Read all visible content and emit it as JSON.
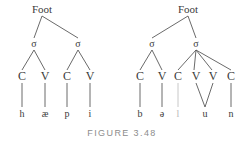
{
  "figure": {
    "caption": "FIGURE 3.48",
    "caption_color": "#8c8c8c",
    "line_color": "#595959",
    "text_color": "#3a3a3a",
    "faint_color": "#b9b9b9",
    "background": "#ffffff"
  },
  "trees": [
    {
      "id": "left-tree",
      "word": "happy",
      "root": {
        "label": "Foot",
        "x": 42,
        "y": 9
      },
      "syllables": [
        {
          "label": "σ",
          "x": 34,
          "y": 44
        },
        {
          "label": "σ",
          "x": 78,
          "y": 44
        }
      ],
      "slots": [
        {
          "label": "C",
          "x": 22,
          "y": 76,
          "syllable": 0
        },
        {
          "label": "V",
          "x": 45,
          "y": 76,
          "syllable": 0
        },
        {
          "label": "C",
          "x": 67,
          "y": 76,
          "syllable": 1
        },
        {
          "label": "V",
          "x": 90,
          "y": 76,
          "syllable": 1
        }
      ],
      "segments": [
        {
          "label": "h",
          "x": 22,
          "y": 114,
          "faint": false
        },
        {
          "label": "æ",
          "x": 45,
          "y": 114,
          "faint": false
        },
        {
          "label": "p",
          "x": 67,
          "y": 114,
          "faint": false
        },
        {
          "label": "i",
          "x": 90,
          "y": 114,
          "faint": false
        }
      ],
      "edges": [
        {
          "from": "foot",
          "to": "sigma-0",
          "x1": 42,
          "y1": 16,
          "x2": 34,
          "y2": 38,
          "faint": false
        },
        {
          "from": "foot",
          "to": "sigma-1",
          "x1": 42,
          "y1": 16,
          "x2": 78,
          "y2": 38,
          "faint": false
        },
        {
          "from": "sigma-0",
          "to": "slot-0",
          "x1": 34,
          "y1": 50,
          "x2": 22,
          "y2": 70,
          "faint": false
        },
        {
          "from": "sigma-0",
          "to": "slot-1",
          "x1": 34,
          "y1": 50,
          "x2": 45,
          "y2": 70,
          "faint": false
        },
        {
          "from": "sigma-1",
          "to": "slot-2",
          "x1": 78,
          "y1": 50,
          "x2": 67,
          "y2": 70,
          "faint": false
        },
        {
          "from": "sigma-1",
          "to": "slot-3",
          "x1": 78,
          "y1": 50,
          "x2": 90,
          "y2": 70,
          "faint": false
        },
        {
          "from": "slot-0",
          "to": "seg-0",
          "x1": 22,
          "y1": 83,
          "x2": 22,
          "y2": 107,
          "faint": false
        },
        {
          "from": "slot-1",
          "to": "seg-1",
          "x1": 45,
          "y1": 83,
          "x2": 45,
          "y2": 107,
          "faint": false
        },
        {
          "from": "slot-2",
          "to": "seg-2",
          "x1": 67,
          "y1": 83,
          "x2": 67,
          "y2": 107,
          "faint": false
        },
        {
          "from": "slot-3",
          "to": "seg-3",
          "x1": 90,
          "y1": 83,
          "x2": 90,
          "y2": 107,
          "faint": false
        }
      ]
    },
    {
      "id": "right-tree",
      "word": "balloon",
      "root": {
        "label": "Foot",
        "x": 188,
        "y": 9
      },
      "syllables": [
        {
          "label": "σ",
          "x": 152,
          "y": 44
        },
        {
          "label": "σ",
          "x": 196,
          "y": 44
        }
      ],
      "slots": [
        {
          "label": "C",
          "x": 140,
          "y": 76,
          "syllable": 0
        },
        {
          "label": "V",
          "x": 162,
          "y": 76,
          "syllable": 0
        },
        {
          "label": "C",
          "x": 178,
          "y": 76,
          "syllable": 1
        },
        {
          "label": "V",
          "x": 196,
          "y": 76,
          "syllable": 1
        },
        {
          "label": "V",
          "x": 213,
          "y": 76,
          "syllable": 1
        },
        {
          "label": "C",
          "x": 231,
          "y": 76,
          "syllable": 1
        }
      ],
      "segments": [
        {
          "label": "b",
          "x": 140,
          "y": 114,
          "faint": false
        },
        {
          "label": "ə",
          "x": 162,
          "y": 114,
          "faint": false
        },
        {
          "label": "l",
          "x": 178,
          "y": 114,
          "faint": true
        },
        {
          "label": "u",
          "x": 205,
          "y": 114,
          "faint": false
        },
        {
          "label": "n",
          "x": 231,
          "y": 114,
          "faint": false
        }
      ],
      "edges": [
        {
          "from": "foot",
          "to": "sigma-0",
          "x1": 188,
          "y1": 16,
          "x2": 152,
          "y2": 38,
          "faint": false
        },
        {
          "from": "foot",
          "to": "sigma-1",
          "x1": 188,
          "y1": 16,
          "x2": 196,
          "y2": 38,
          "faint": false
        },
        {
          "from": "sigma-0",
          "to": "slot-0",
          "x1": 152,
          "y1": 50,
          "x2": 140,
          "y2": 70,
          "faint": false
        },
        {
          "from": "sigma-0",
          "to": "slot-1",
          "x1": 152,
          "y1": 50,
          "x2": 162,
          "y2": 70,
          "faint": false
        },
        {
          "from": "sigma-1",
          "to": "slot-2",
          "x1": 196,
          "y1": 50,
          "x2": 178,
          "y2": 70,
          "faint": false
        },
        {
          "from": "sigma-1",
          "to": "slot-3",
          "x1": 196,
          "y1": 50,
          "x2": 194,
          "y2": 70,
          "faint": false
        },
        {
          "from": "sigma-1",
          "to": "slot-4",
          "x1": 196,
          "y1": 50,
          "x2": 212,
          "y2": 70,
          "faint": false
        },
        {
          "from": "sigma-1",
          "to": "slot-5",
          "x1": 196,
          "y1": 50,
          "x2": 231,
          "y2": 70,
          "faint": false
        },
        {
          "from": "slot-0",
          "to": "seg-0",
          "x1": 140,
          "y1": 83,
          "x2": 140,
          "y2": 107,
          "faint": false
        },
        {
          "from": "slot-1",
          "to": "seg-1",
          "x1": 162,
          "y1": 83,
          "x2": 162,
          "y2": 107,
          "faint": false
        },
        {
          "from": "slot-2",
          "to": "seg-2",
          "x1": 178,
          "y1": 83,
          "x2": 178,
          "y2": 107,
          "faint": true
        },
        {
          "from": "slot-3",
          "to": "seg-3",
          "x1": 196,
          "y1": 83,
          "x2": 205,
          "y2": 107,
          "faint": false
        },
        {
          "from": "slot-4",
          "to": "seg-3",
          "x1": 213,
          "y1": 83,
          "x2": 205,
          "y2": 107,
          "faint": false
        },
        {
          "from": "slot-5",
          "to": "seg-4",
          "x1": 231,
          "y1": 83,
          "x2": 231,
          "y2": 107,
          "faint": false
        }
      ]
    }
  ]
}
